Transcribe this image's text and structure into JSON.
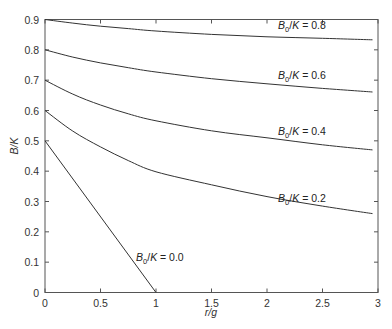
{
  "chart_data": {
    "type": "line",
    "title": "",
    "xlabel": "r/g",
    "ylabel": "B/K",
    "xlim": [
      0,
      3
    ],
    "ylim": [
      0,
      0.9
    ],
    "grid": false,
    "legend": "none (inline curve labels)",
    "xticks": [
      "0",
      "0.5",
      "1",
      "1.5",
      "2",
      "2.5",
      "3"
    ],
    "yticks": [
      "0",
      "0.1",
      "0.2",
      "0.3",
      "0.4",
      "0.5",
      "0.6",
      "0.7",
      "0.8",
      "0.9"
    ],
    "series": [
      {
        "name": "B0/K = 0.8",
        "label_parts": {
          "b": "B",
          "sub": "0",
          "rest": "/K = 0.8"
        },
        "label_pos": [
          2.1,
          0.87
        ],
        "x": [
          0,
          0.25,
          0.5,
          0.75,
          1,
          1.5,
          2,
          2.5,
          2.95
        ],
        "y": [
          0.9,
          0.888,
          0.878,
          0.87,
          0.862,
          0.851,
          0.843,
          0.838,
          0.833
        ]
      },
      {
        "name": "B0/K = 0.6",
        "label_parts": {
          "b": "B",
          "sub": "0",
          "rest": "/K = 0.6"
        },
        "label_pos": [
          2.1,
          0.705
        ],
        "x": [
          0,
          0.25,
          0.5,
          0.75,
          1,
          1.5,
          2,
          2.5,
          2.95
        ],
        "y": [
          0.8,
          0.776,
          0.757,
          0.741,
          0.727,
          0.705,
          0.688,
          0.673,
          0.661
        ]
      },
      {
        "name": "B0/K = 0.4",
        "label_parts": {
          "b": "B",
          "sub": "0",
          "rest": "/K = 0.4"
        },
        "label_pos": [
          2.1,
          0.52
        ],
        "x": [
          0,
          0.25,
          0.5,
          0.75,
          1,
          1.5,
          2,
          2.5,
          2.95
        ],
        "y": [
          0.7,
          0.654,
          0.618,
          0.589,
          0.566,
          0.533,
          0.51,
          0.487,
          0.47
        ]
      },
      {
        "name": "B0/K = 0.2",
        "label_parts": {
          "b": "B",
          "sub": "0",
          "rest": "/K = 0.2"
        },
        "label_pos": [
          2.1,
          0.3
        ],
        "x": [
          0,
          0.25,
          0.5,
          0.75,
          1,
          1.5,
          2,
          2.5,
          2.95
        ],
        "y": [
          0.6,
          0.532,
          0.48,
          0.435,
          0.398,
          0.355,
          0.316,
          0.285,
          0.26
        ]
      },
      {
        "name": "B0/K = 0.0",
        "label_parts": {
          "b": "B",
          "sub": "0",
          "rest": "/K = 0.0"
        },
        "label_pos": [
          0.82,
          0.105
        ],
        "x": [
          0,
          1
        ],
        "y": [
          0.5,
          0.0
        ]
      }
    ]
  }
}
